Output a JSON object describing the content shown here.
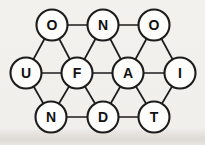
{
  "diagram": {
    "description_label": "letter network puzzle",
    "node_radius": 15.5,
    "edge_stroke_width": 1.7,
    "circle_stroke_width": 2.1,
    "letter_font_size": 14,
    "colors": {
      "background": "#f1efec",
      "circle_fill": "#fdfdfc",
      "stroke": "#1c1c1c",
      "letter": "#111111"
    },
    "nodes": [
      {
        "id": "o1",
        "letter": "O",
        "x": 52,
        "y": 25
      },
      {
        "id": "n1",
        "letter": "N",
        "x": 103,
        "y": 25
      },
      {
        "id": "o2",
        "letter": "O",
        "x": 154,
        "y": 25
      },
      {
        "id": "u",
        "letter": "U",
        "x": 26,
        "y": 73
      },
      {
        "id": "f",
        "letter": "F",
        "x": 77,
        "y": 73
      },
      {
        "id": "a",
        "letter": "A",
        "x": 128,
        "y": 73
      },
      {
        "id": "i",
        "letter": "I",
        "x": 180,
        "y": 73
      },
      {
        "id": "n2",
        "letter": "N",
        "x": 51,
        "y": 117
      },
      {
        "id": "d",
        "letter": "D",
        "x": 103,
        "y": 117
      },
      {
        "id": "t",
        "letter": "T",
        "x": 154,
        "y": 117
      }
    ],
    "edges": [
      [
        "o1",
        "n1"
      ],
      [
        "n1",
        "o2"
      ],
      [
        "o1",
        "u"
      ],
      [
        "o1",
        "f"
      ],
      [
        "n1",
        "f"
      ],
      [
        "n1",
        "a"
      ],
      [
        "o2",
        "a"
      ],
      [
        "o2",
        "i"
      ],
      [
        "u",
        "f"
      ],
      [
        "f",
        "a"
      ],
      [
        "a",
        "i"
      ],
      [
        "u",
        "n2"
      ],
      [
        "f",
        "n2"
      ],
      [
        "f",
        "d"
      ],
      [
        "a",
        "d"
      ],
      [
        "a",
        "t"
      ],
      [
        "i",
        "t"
      ],
      [
        "n2",
        "d"
      ],
      [
        "d",
        "t"
      ]
    ]
  }
}
